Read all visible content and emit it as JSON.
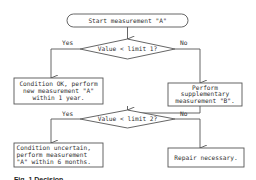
{
  "flowchart": {
    "start": {
      "label": "Start measurement \"A\""
    },
    "decision1": {
      "label": "Value < limit 1?",
      "yes_label": "Yes",
      "no_label": "No"
    },
    "yes1_box": {
      "lines": [
        "Condition OK, perform",
        "new measurement \"A\"",
        "within 1 year."
      ]
    },
    "no1_box": {
      "lines": [
        "Perform",
        "supplementary",
        "measurement \"B\"."
      ]
    },
    "decision2": {
      "label": "Value < limit 2?",
      "yes_label": "Yes",
      "no_label": "No"
    },
    "yes2_box": {
      "lines": [
        "Condition uncertain,",
        "perform measurement",
        "\"A\" within 6 months."
      ]
    },
    "no2_box": {
      "lines": [
        "Repair necessary."
      ]
    }
  },
  "caption": "Fig. 1 Decision"
}
